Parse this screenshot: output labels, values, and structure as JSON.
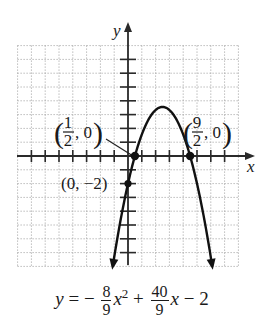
{
  "chart_data": {
    "type": "line",
    "title": "",
    "xlabel": "x",
    "ylabel": "y",
    "function": "y = -8/9 x^2 + 40/9 x - 2",
    "coefficients": {
      "a": -0.8889,
      "b": 4.4444,
      "c": -2
    },
    "xlim": [
      -8,
      8
    ],
    "ylim": [
      -8,
      8
    ],
    "grid": true,
    "tick_step": 1,
    "vertex": {
      "x": 2.5,
      "y": 3.56
    },
    "x_range_plotted": [
      -1.1,
      6.1
    ],
    "arrows_at_ends": true,
    "labeled_points": [
      {
        "x": 0.5,
        "y": 0,
        "label_open": "(",
        "num": "1",
        "den": "2",
        "label_close": ", 0)"
      },
      {
        "x": 4.5,
        "y": 0,
        "label_open": "(",
        "num": "9",
        "den": "2",
        "label_close": ", 0)"
      },
      {
        "x": 0,
        "y": -2,
        "label": "(0, −2)"
      }
    ]
  },
  "axes": {
    "x_label": "x",
    "y_label": "y"
  },
  "labels": {
    "point1": {
      "num": "1",
      "den": "2",
      "rest": ", 0"
    },
    "point2": {
      "num": "9",
      "den": "2",
      "rest": ", 0"
    },
    "point3": "(0, −2)"
  },
  "equation": {
    "y": "y",
    "eq": " = −",
    "f1_num": "8",
    "f1_den": "9",
    "x2": "x",
    "sq": "2",
    "plus": " + ",
    "f2_num": "40",
    "f2_den": "9",
    "x1": "x",
    "tail": " − 2"
  }
}
